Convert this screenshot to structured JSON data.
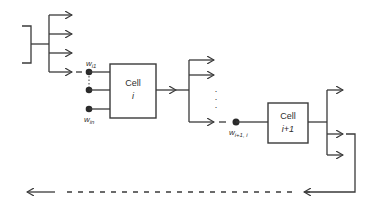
{
  "diagram": {
    "cells": [
      {
        "id": "cell-i",
        "label": "Cell",
        "index": "i"
      },
      {
        "id": "cell-i-plus-1",
        "label": "Cell",
        "index": "i+1"
      }
    ],
    "weights": {
      "first": {
        "base": "w",
        "sub": "i1"
      },
      "last": {
        "base": "w",
        "sub": "in"
      },
      "link": {
        "base": "w",
        "sub": "i+1, i"
      }
    },
    "dots": ".\n.\n.",
    "colors": {
      "line": "#3a3a3a",
      "background": "#ffffff"
    }
  }
}
